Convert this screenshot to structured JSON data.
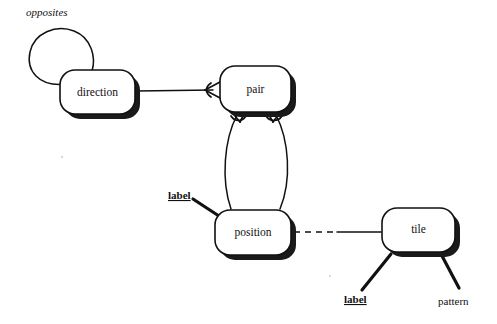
{
  "diagram": {
    "background_color": "#ffffff",
    "line_color": "#111111",
    "entities": [
      {
        "id": "direction",
        "label": "direction",
        "x": 60,
        "y": 70,
        "w": 75,
        "h": 44
      },
      {
        "id": "pair",
        "label": "pair",
        "x": 220,
        "y": 66,
        "w": 71,
        "h": 46
      },
      {
        "id": "position",
        "label": "position",
        "x": 215,
        "y": 210,
        "w": 76,
        "h": 45
      },
      {
        "id": "tile",
        "label": "tile",
        "x": 382,
        "y": 208,
        "w": 73,
        "h": 44
      }
    ],
    "roles": [
      {
        "id": "opposites",
        "label": "opposites",
        "style": "italic",
        "x": 26,
        "y": 14
      }
    ],
    "attributes": [
      {
        "id": "position-label",
        "label": "label",
        "style": "key",
        "owner": "position",
        "x": 168,
        "y": 196
      },
      {
        "id": "tile-label",
        "label": "label",
        "style": "key",
        "owner": "tile",
        "x": 344,
        "y": 300
      },
      {
        "id": "tile-pattern",
        "label": "pattern",
        "style": "plain",
        "owner": "tile",
        "x": 438,
        "y": 302
      }
    ],
    "connections": [
      {
        "id": "direction-pair",
        "from": "direction",
        "to": "pair",
        "style": "solid",
        "end_marker": "crowsfoot"
      },
      {
        "id": "pair-position-left",
        "from": "pair",
        "to": "position",
        "style": "curved",
        "end_marker": "crowsfoot"
      },
      {
        "id": "pair-position-right",
        "from": "pair",
        "to": "position",
        "style": "curved",
        "end_marker": "crowsfoot"
      },
      {
        "id": "position-tile",
        "from": "position",
        "to": "tile",
        "style": "dashed-then-solid",
        "end_marker": "none"
      },
      {
        "id": "direction-self-loop",
        "from": "direction",
        "to": "direction",
        "style": "self-loop",
        "end_marker": "none"
      }
    ]
  }
}
